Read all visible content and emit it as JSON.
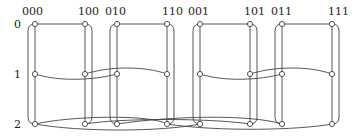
{
  "diagram": {
    "column_labels": [
      "000",
      "100",
      "010",
      "110",
      "001",
      "101",
      "011",
      "111"
    ],
    "row_labels": [
      "0",
      "1",
      "2"
    ],
    "columns_x": [
      35,
      85,
      117,
      167,
      200,
      250,
      282,
      332
    ],
    "rows_y": [
      24,
      74,
      124
    ],
    "colors": {
      "stroke": "#444444",
      "node_fill": "#ffffff",
      "text": "#222222"
    },
    "row0_edges": [
      [
        "000",
        "100"
      ],
      [
        "010",
        "110"
      ],
      [
        "001",
        "101"
      ],
      [
        "011",
        "111"
      ]
    ],
    "row1_edges": [
      [
        "000",
        "010"
      ],
      [
        "100",
        "110"
      ],
      [
        "001",
        "011"
      ],
      [
        "101",
        "111"
      ]
    ],
    "row2_edges": [
      [
        "000",
        "001"
      ],
      [
        "100",
        "101"
      ],
      [
        "010",
        "011"
      ],
      [
        "110",
        "111"
      ]
    ]
  }
}
